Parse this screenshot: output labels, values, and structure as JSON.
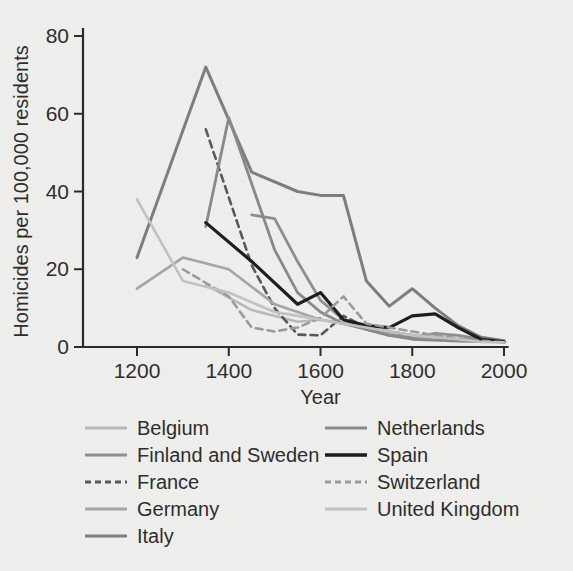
{
  "chart_data": {
    "type": "line",
    "title": "",
    "xlabel": "Year",
    "ylabel": "Homicides per 100,000 residents",
    "xlim": [
      1150,
      2010
    ],
    "ylim": [
      0,
      85
    ],
    "xticks": [
      1200,
      1400,
      1600,
      1800,
      2000
    ],
    "yticks": [
      0,
      20,
      40,
      60,
      80
    ],
    "grid": false,
    "legend_position": "below-plot-two-columns",
    "series": [
      {
        "name": "Belgium",
        "color": "#b9b9b9",
        "style": "solid",
        "width": 2.6,
        "x": [
          1350,
          1450,
          1550,
          1600,
          1700,
          1750,
          1800,
          1850,
          1900,
          1950,
          2000
        ],
        "values": [
          16.0,
          9.5,
          6.5,
          7.0,
          5.0,
          3.5,
          2.5,
          2.0,
          1.6,
          1.4,
          1.4
        ]
      },
      {
        "name": "Finland and Sweden",
        "color": "#8f8f8f",
        "style": "solid",
        "width": 2.8,
        "x": [
          1450,
          1500,
          1550,
          1600,
          1650,
          1700,
          1750,
          1800,
          1850,
          1900,
          1950,
          2000
        ],
        "values": [
          34.0,
          33.0,
          22.0,
          12.0,
          7.0,
          4.5,
          3.0,
          2.5,
          3.5,
          3.0,
          2.0,
          1.6
        ]
      },
      {
        "name": "France",
        "color": "#595959",
        "style": "dashed",
        "width": 2.6,
        "x": [
          1350,
          1450,
          1500,
          1550,
          1600,
          1650,
          1700,
          1750,
          1800,
          1850,
          1900,
          1950,
          2000
        ],
        "values": [
          56.0,
          21.0,
          10.0,
          3.2,
          3.0,
          8.0,
          5.0,
          4.0,
          3.0,
          2.5,
          2.0,
          1.6,
          1.3
        ]
      },
      {
        "name": "Germany",
        "color": "#a6a6a6",
        "style": "solid",
        "width": 2.6,
        "x": [
          1200,
          1300,
          1400,
          1500,
          1600,
          1700,
          1800,
          1850,
          1900,
          1950,
          2000
        ],
        "values": [
          15.0,
          23.0,
          20.0,
          11.0,
          7.0,
          5.0,
          3.0,
          2.2,
          1.8,
          1.5,
          1.3
        ]
      },
      {
        "name": "Italy",
        "color": "#7e7e7e",
        "style": "solid",
        "width": 3.0,
        "x": [
          1200,
          1350,
          1450,
          1550,
          1600,
          1650,
          1700,
          1750,
          1800,
          1850,
          1900,
          1950,
          2000
        ],
        "values": [
          23.0,
          72.0,
          45.0,
          40.0,
          39.0,
          39.0,
          17.0,
          10.5,
          15.0,
          10.0,
          5.5,
          2.5,
          1.6
        ]
      },
      {
        "name": "Netherlands",
        "color": "#8a8a8a",
        "style": "solid",
        "width": 2.8,
        "x": [
          1350,
          1400,
          1500,
          1550,
          1600,
          1650,
          1700,
          1750,
          1800,
          1900,
          2000
        ],
        "values": [
          31.0,
          59.0,
          25.0,
          14.0,
          9.0,
          6.0,
          4.5,
          3.0,
          2.0,
          1.5,
          1.3
        ]
      },
      {
        "name": "Spain",
        "color": "#1e1e1e",
        "style": "solid",
        "width": 3.2,
        "x": [
          1350,
          1450,
          1550,
          1600,
          1650,
          1700,
          1750,
          1800,
          1850,
          1900,
          1950,
          2000
        ],
        "values": [
          32.0,
          22.0,
          11.0,
          14.0,
          7.0,
          5.5,
          5.0,
          8.0,
          8.5,
          5.0,
          2.0,
          1.3
        ]
      },
      {
        "name": "Switzerland",
        "color": "#9c9c9c",
        "style": "dashed",
        "width": 2.6,
        "x": [
          1300,
          1400,
          1450,
          1500,
          1550,
          1600,
          1650,
          1700,
          1750,
          1800,
          1850,
          1900,
          1950,
          2000
        ],
        "values": [
          20.0,
          13.0,
          5.0,
          4.0,
          5.0,
          7.5,
          13.0,
          6.0,
          5.0,
          4.0,
          3.0,
          2.2,
          1.6,
          1.2
        ]
      },
      {
        "name": "United Kingdom",
        "color": "#c2c2c2",
        "style": "solid",
        "width": 2.6,
        "x": [
          1200,
          1300,
          1400,
          1500,
          1550,
          1600,
          1650,
          1700,
          1800,
          1900,
          1950,
          2000
        ],
        "values": [
          38.0,
          17.0,
          14.0,
          9.0,
          8.0,
          7.0,
          6.0,
          5.0,
          3.0,
          2.0,
          1.3,
          1.2
        ]
      }
    ]
  },
  "axes": {
    "x_title": "Year",
    "y_title": "Homicides per 100,000 residents",
    "x_tick_labels": [
      "1200",
      "1400",
      "1600",
      "1800",
      "2000"
    ],
    "y_tick_labels": [
      "0",
      "20",
      "40",
      "60",
      "80"
    ]
  },
  "legend": {
    "column_left": [
      {
        "label": "Belgium",
        "color": "#b9b9b9",
        "style": "solid"
      },
      {
        "label": "Finland and Sweden",
        "color": "#8f8f8f",
        "style": "solid"
      },
      {
        "label": "France",
        "color": "#595959",
        "style": "dashed"
      },
      {
        "label": "Germany",
        "color": "#a6a6a6",
        "style": "solid"
      },
      {
        "label": "Italy",
        "color": "#7e7e7e",
        "style": "solid"
      }
    ],
    "column_right": [
      {
        "label": "Netherlands",
        "color": "#8a8a8a",
        "style": "solid"
      },
      {
        "label": "Spain",
        "color": "#1e1e1e",
        "style": "solid"
      },
      {
        "label": "Switzerland",
        "color": "#9c9c9c",
        "style": "dashed"
      },
      {
        "label": "United Kingdom",
        "color": "#c2c2c2",
        "style": "solid"
      }
    ]
  },
  "theme": {
    "background": "#efefed",
    "axis_color": "#2b2b2b",
    "text_color": "#2e2e2e"
  }
}
